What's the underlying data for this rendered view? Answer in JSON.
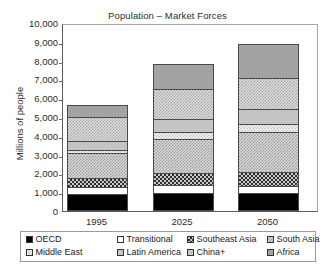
{
  "chart_data": {
    "type": "bar",
    "subtype": "stacked-bar",
    "title": "Population – Market Forces",
    "xlabel": "",
    "ylabel": "Millions of people",
    "categories": [
      "1995",
      "2025",
      "2050"
    ],
    "ylim": [
      0,
      10000
    ],
    "ytick_labels": [
      "10,000",
      "9,000",
      "8,000",
      "7,000",
      "6,000",
      "5,000",
      "4,000",
      "3,000",
      "2,000",
      "1,000",
      "0"
    ],
    "ytick_values": [
      10000,
      9000,
      8000,
      7000,
      6000,
      5000,
      4000,
      3000,
      2000,
      1000,
      0
    ],
    "grid": false,
    "legend_position": "bottom",
    "series": [
      {
        "name": "OECD",
        "values": [
          900,
          950,
          950
        ],
        "pattern": "solid-black",
        "color": "#000000"
      },
      {
        "name": "Transitional",
        "values": [
          400,
          450,
          400
        ],
        "pattern": "empty-white",
        "color": "#ffffff"
      },
      {
        "name": "Southeast Asia",
        "values": [
          450,
          600,
          750
        ],
        "pattern": "dark-checkerboard",
        "color": "#2e2e2e"
      },
      {
        "name": "South Asia",
        "values": [
          1350,
          1850,
          2100
        ],
        "pattern": "medium-dotted",
        "color": "#9b9b9b"
      },
      {
        "name": "Middle East",
        "values": [
          150,
          350,
          450
        ],
        "pattern": "light-sparse-dots",
        "color": "#c2c2c2"
      },
      {
        "name": "Latin America",
        "values": [
          450,
          700,
          800
        ],
        "pattern": "light-solid",
        "color": "#c4c4c4"
      },
      {
        "name": "China+",
        "values": [
          1300,
          1600,
          1650
        ],
        "pattern": "light-dotted",
        "color": "#a6a6a6"
      },
      {
        "name": "Africa",
        "values": [
          650,
          1300,
          1800
        ],
        "pattern": "medium-solid",
        "color": "#a3a3a3"
      }
    ],
    "totals": [
      5650,
      7800,
      8900
    ]
  }
}
